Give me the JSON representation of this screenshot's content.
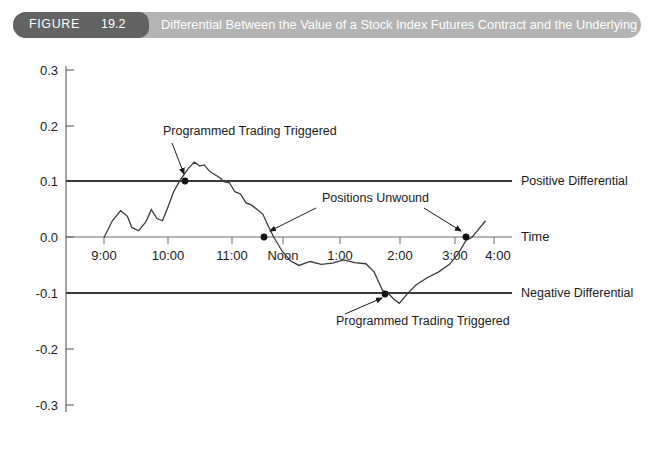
{
  "figure": {
    "tag_word": "FIGURE",
    "tag_number": "19.2",
    "title": "Differential Between the Value of a Stock Index Futures Contract and the Underlying Stocks",
    "tag_bg": "#636363",
    "band_bg": "#b3b3b3",
    "title_color": "#ffffff"
  },
  "chart_data": {
    "type": "line",
    "title": "Differential Between the Value of a Stock Index Futures Contract and the Underlying Stocks",
    "xlabel": "Time",
    "ylabel": "",
    "xlim": [
      "9:00",
      "4:00"
    ],
    "ylim": [
      -0.3,
      0.3
    ],
    "grid": false,
    "legend": "none",
    "x_tick_labels": [
      "9:00",
      "10:00",
      "11:00",
      "Noon",
      "1:00",
      "2:00",
      "3:00",
      "4:00"
    ],
    "y_tick_labels": [
      "0.3",
      "0.2",
      "0.1",
      "0.0",
      "-0.1",
      "-0.2",
      "-0.3"
    ],
    "y_tick_values": [
      0.3,
      0.2,
      0.1,
      0.0,
      -0.1,
      -0.2,
      -0.3
    ],
    "reference_lines": [
      {
        "name": "positive-differential",
        "value": 0.1,
        "label": "Positive Differential"
      },
      {
        "name": "zero-axis",
        "value": 0.0,
        "label": "Time"
      },
      {
        "name": "negative-differential",
        "value": -0.1,
        "label": "Negative Differential"
      }
    ],
    "series": [
      {
        "name": "differential",
        "color": "#3a3a3a",
        "x": [
          9.0,
          9.15,
          9.3,
          9.42,
          9.5,
          9.62,
          9.75,
          9.85,
          9.95,
          10.05,
          10.15,
          10.25,
          10.35,
          10.5,
          10.62,
          10.72,
          10.8,
          10.9,
          11.0,
          11.08,
          11.15,
          11.25,
          11.35,
          11.45,
          11.55,
          11.65,
          11.75,
          11.85,
          11.95,
          12.05,
          12.2,
          12.35,
          12.5,
          12.7,
          12.9,
          13.1,
          13.3,
          13.5,
          13.7,
          13.85,
          14.0,
          14.1,
          14.2,
          14.3,
          14.45,
          14.6,
          14.8,
          15.0,
          15.2,
          15.35,
          15.5,
          15.6,
          15.7,
          15.85
        ],
        "y": [
          0.0,
          0.03,
          0.048,
          0.038,
          0.018,
          0.012,
          0.028,
          0.05,
          0.034,
          0.03,
          0.055,
          0.082,
          0.1,
          0.122,
          0.135,
          0.128,
          0.13,
          0.118,
          0.112,
          0.107,
          0.1,
          0.098,
          0.082,
          0.078,
          0.062,
          0.058,
          0.05,
          0.042,
          0.02,
          0.0,
          -0.025,
          -0.042,
          -0.05,
          -0.043,
          -0.048,
          -0.046,
          -0.04,
          -0.045,
          -0.047,
          -0.062,
          -0.095,
          -0.1,
          -0.11,
          -0.118,
          -0.1,
          -0.085,
          -0.072,
          -0.062,
          -0.048,
          -0.03,
          -0.005,
          0.0,
          0.012,
          0.03
        ]
      }
    ],
    "annotations": [
      {
        "name": "programmed-trading-triggered-top",
        "text": "Programmed Trading Triggered",
        "text_x": 163,
        "text_y": 135,
        "arrow_from_x": 172,
        "arrow_from_y": 142,
        "arrow_to_x": 185,
        "arrow_to_y": 179,
        "marker_x": 185,
        "marker_y": 181
      },
      {
        "name": "positions-unwound",
        "text": "Positions Unwound",
        "text_x": 322,
        "text_y": 201,
        "arrows": [
          {
            "from_x": 316,
            "from_y": 207,
            "to_x": 266,
            "to_y": 234,
            "marker_x": 263,
            "marker_y": 236
          },
          {
            "from_x": 420,
            "from_y": 207,
            "to_x": 463,
            "to_y": 234,
            "marker_x": 466,
            "marker_y": 236
          }
        ]
      },
      {
        "name": "programmed-trading-triggered-bottom",
        "text": "Programmed Trading Triggered",
        "text_x": 336,
        "text_y": 323,
        "arrow_from_x": 343,
        "arrow_from_y": 312,
        "arrow_to_x": 383,
        "arrow_to_y": 296,
        "marker_x": 385,
        "marker_y": 294
      }
    ]
  },
  "labels": {
    "positive_differential": "Positive Differential",
    "negative_differential": "Negative Differential",
    "time_axis": "Time"
  }
}
